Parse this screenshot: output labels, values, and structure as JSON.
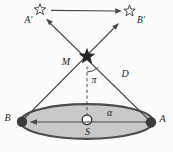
{
  "figure": {
    "labels": {
      "a_prime": "A′",
      "b_prime": "B′",
      "m": "M",
      "pi": "π",
      "d": "D",
      "alpha": "α",
      "b": "B",
      "a": "A",
      "s": "S"
    },
    "colors": {
      "background": "#fcfcfc",
      "ink": "#1f1f1f",
      "line": "#4a4a4a",
      "ellipse_fill": "#c9c9c9",
      "ellipse_stroke": "#4d4d4d",
      "dot": "#3a3a3a",
      "star_dark": "#242424",
      "star_open": "#fcfcfc"
    }
  }
}
